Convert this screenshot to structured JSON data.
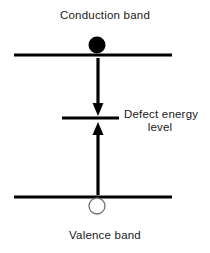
{
  "figure": {
    "type": "energy-band-diagram",
    "width": 210,
    "height": 253,
    "background_color": "#ffffff",
    "line_color": "#000000",
    "text_color": "#1a1a1a",
    "carrier_outline_color": "#707070"
  },
  "labels": {
    "conduction_band": "Conduction band",
    "valence_band": "Valence band",
    "defect_level_line1": "Defect energy",
    "defect_level_line2": "level"
  },
  "bands": {
    "conduction": {
      "name": "Conduction band",
      "x1": 14,
      "x2": 172,
      "y": 55,
      "thickness": 3
    },
    "defect": {
      "name": "Defect energy level",
      "x1": 62,
      "x2": 119,
      "y": 118,
      "thickness": 3
    },
    "valence": {
      "name": "Valence band",
      "x1": 14,
      "x2": 172,
      "y": 197,
      "thickness": 3
    }
  },
  "carriers": {
    "electron": {
      "name": "electron",
      "fill": "#000000",
      "cx": 97,
      "cy": 45,
      "r": 8.5
    },
    "hole": {
      "name": "hole",
      "fill": "#ffffff",
      "stroke": "#707070",
      "cx": 97,
      "cy": 206,
      "r": 8.5
    }
  },
  "transitions": {
    "capture": {
      "name": "electron capture",
      "direction": "down",
      "x": 98,
      "y_start": 58,
      "y_end": 116,
      "shaft_width": 3,
      "head_width": 11,
      "head_length": 11
    },
    "emission": {
      "name": "hole capture",
      "direction": "up",
      "x": 98,
      "y_start": 195,
      "y_end": 122,
      "shaft_width": 3,
      "head_width": 11,
      "head_length": 11
    }
  }
}
